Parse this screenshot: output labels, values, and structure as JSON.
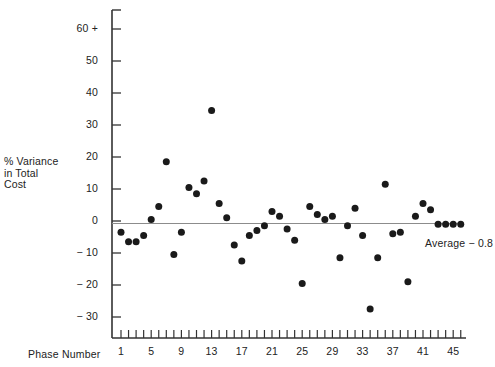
{
  "chart_data": {
    "type": "scatter",
    "title": "",
    "xlabel": "Phase Number",
    "ylabel": "% Variance in Total Cost",
    "ylabel_lines": [
      "% Variance",
      "in Total",
      "Cost"
    ],
    "xlim": [
      0,
      47
    ],
    "ylim": [
      -35,
      65
    ],
    "grid": false,
    "legend": "none",
    "y_ticks": [
      {
        "value": 60,
        "label": "60 +"
      },
      {
        "value": 50,
        "label": "50"
      },
      {
        "value": 40,
        "label": "40"
      },
      {
        "value": 30,
        "label": "30"
      },
      {
        "value": 20,
        "label": "20"
      },
      {
        "value": 10,
        "label": "10"
      },
      {
        "value": 0,
        "label": "0"
      },
      {
        "value": -10,
        "label": "− 10"
      },
      {
        "value": -20,
        "label": "− 20"
      },
      {
        "value": -30,
        "label": "− 30"
      }
    ],
    "x_ticks_labeled": [
      {
        "value": 1,
        "label": "1"
      },
      {
        "value": 5,
        "label": "5"
      },
      {
        "value": 9,
        "label": "9"
      },
      {
        "value": 13,
        "label": "13"
      },
      {
        "value": 17,
        "label": "17"
      },
      {
        "value": 21,
        "label": "21"
      },
      {
        "value": 25,
        "label": "25"
      },
      {
        "value": 29,
        "label": "29"
      },
      {
        "value": 33,
        "label": "33"
      },
      {
        "value": 37,
        "label": "37"
      },
      {
        "value": 41,
        "label": "41"
      },
      {
        "value": 45,
        "label": "45"
      }
    ],
    "x_minor_tick_range": [
      1,
      46
    ],
    "x": [
      1,
      2,
      3,
      4,
      5,
      6,
      7,
      8,
      9,
      10,
      11,
      12,
      13,
      14,
      15,
      16,
      17,
      18,
      19,
      20,
      21,
      22,
      23,
      24,
      25,
      26,
      27,
      28,
      29,
      30,
      31,
      32,
      33,
      34,
      35,
      36,
      37,
      38,
      39,
      40,
      41,
      42,
      43,
      44,
      45,
      46
    ],
    "y": [
      -3.5,
      -6.5,
      -6.5,
      -4.5,
      0.5,
      4.5,
      18.5,
      -10.5,
      -3.5,
      10.5,
      8.5,
      12.5,
      34.5,
      5.5,
      1.0,
      -7.5,
      -12.5,
      -4.5,
      -3.0,
      -1.5,
      3.0,
      1.5,
      -2.5,
      -6.0,
      -19.5,
      4.5,
      2.0,
      0.5,
      1.5,
      -11.5,
      -1.5,
      4.0,
      -4.5,
      -27.5,
      -11.5,
      11.5,
      -4.0,
      -3.5,
      -19.0,
      1.5,
      5.5,
      3.5,
      -1.0,
      -1.0,
      -1.0,
      -1.0
    ],
    "reference_line": {
      "label": "Average",
      "value": -0.8,
      "display": "Average  − 0.8",
      "type": "horizontal"
    },
    "marker": {
      "shape": "circle",
      "color": "#1a1a1a",
      "size_px": 7
    },
    "axis_color": "#333333",
    "reference_line_color": "#8c8c8c"
  },
  "footer": {
    "smudged_text": ""
  }
}
